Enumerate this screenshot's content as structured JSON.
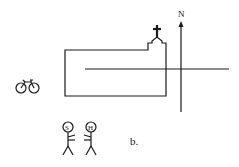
{
  "diagram": {
    "compass_label": "N",
    "figures": [
      {
        "label": "S"
      },
      {
        "label": "H"
      }
    ],
    "caption": "b.",
    "elements": [
      "church-building",
      "cross",
      "horizontal-road",
      "north-arrow",
      "bicycle",
      "stick-figure-s",
      "stick-figure-h"
    ],
    "colors": {
      "ink": "#1a1a1a",
      "background": "#ffffff"
    }
  }
}
